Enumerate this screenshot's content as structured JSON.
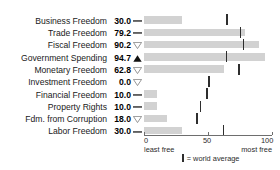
{
  "title": "INDEX OF ECONOMIC FREEDOM COMPONENT FREEDOMS",
  "chart_data": {
    "type": "bar",
    "title": "INDEX OF ECONOMIC FREEDOM COMPONENT FREEDOMS",
    "orientation": "horizontal",
    "xlabel": "",
    "ylabel": "",
    "xlim": [
      0,
      100
    ],
    "ticks": [
      "0",
      "50",
      "100"
    ],
    "tick_values": [
      0,
      50,
      100
    ],
    "grid": false,
    "axis_low_label": "least free",
    "axis_high_label": "most free",
    "legend_text": "= world average",
    "legend_position": "bottom-center",
    "bar_color": "#d2d2d2",
    "average_marker_color": "#2e2e2e",
    "categories": [
      "Business Freedom",
      "Trade Freedom",
      "Fiscal Freedom",
      "Government Spending",
      "Monetary Freedom",
      "Investment Freedom",
      "Financial Freedom",
      "Property Rights",
      "Fdm. from Corruption",
      "Labor Freedom"
    ],
    "values": [
      30.0,
      79.2,
      90.2,
      94.7,
      62.8,
      0.0,
      10.0,
      10.0,
      18.0,
      30.0
    ],
    "value_labels": [
      "30.0",
      "79.2",
      "90.2",
      "94.7",
      "62.8",
      "0.0",
      "10.0",
      "10.0",
      "18.0",
      "30.0"
    ],
    "world_average": [
      64.3,
      74.8,
      77.0,
      63.7,
      73.4,
      50.2,
      48.5,
      43.6,
      40.5,
      61.5
    ],
    "trend": [
      "flat",
      "flat",
      "down",
      "up",
      "down",
      "down",
      "flat",
      "flat",
      "down",
      "flat"
    ],
    "trend_glyphs": [
      "dash",
      "dash",
      "hollow-down-triangle",
      "filled-up-triangle",
      "hollow-down-triangle",
      "hollow-down-triangle",
      "dash",
      "dash",
      "hollow-down-triangle",
      "dash"
    ]
  }
}
